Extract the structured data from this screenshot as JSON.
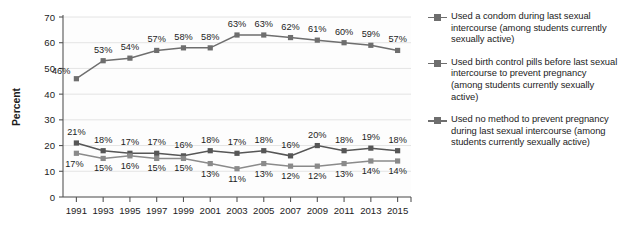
{
  "chart_data": {
    "type": "line",
    "title": "",
    "xlabel": "",
    "ylabel": "Percent",
    "ylim": [
      0,
      70
    ],
    "ytick_step": 10,
    "yticks": [
      0,
      10,
      20,
      30,
      40,
      50,
      60,
      70
    ],
    "grid": true,
    "grid_axis": "y",
    "legend_position": "right",
    "value_suffix": "%",
    "categories": [
      "1991",
      "1993",
      "1995",
      "1997",
      "1999",
      "2001",
      "2003",
      "2005",
      "2007",
      "2009",
      "2011",
      "2013",
      "2015"
    ],
    "series": [
      {
        "name": "Used a condom during last sexual intercourse (among students currently sexually active)",
        "color": "#6e6e6e",
        "values": [
          46,
          53,
          54,
          57,
          58,
          58,
          63,
          63,
          62,
          61,
          60,
          59,
          57
        ],
        "labels": [
          "46%",
          "53%",
          "54%",
          "57%",
          "58%",
          "58%",
          "63%",
          "63%",
          "62%",
          "61%",
          "60%",
          "59%",
          "57%"
        ]
      },
      {
        "name": "Used no method to prevent pregnancy during last sexual intercourse (among students currently sexually active)",
        "color": "#565656",
        "values": [
          21,
          18,
          17,
          17,
          16,
          18,
          17,
          18,
          16,
          20,
          18,
          19,
          18
        ],
        "labels": [
          "21%",
          "18%",
          "17%",
          "17%",
          "16%",
          "18%",
          "17%",
          "18%",
          "16%",
          "20%",
          "18%",
          "19%",
          "18%"
        ]
      },
      {
        "name": "Used birth control pills before last sexual intercourse to prevent pregnancy (among students currently sexually active)",
        "color": "#8a8a8a",
        "values": [
          17,
          15,
          16,
          15,
          15,
          13,
          11,
          13,
          12,
          12,
          13,
          14,
          14
        ],
        "labels": [
          "17%",
          "15%",
          "16%",
          "15%",
          "15%",
          "13%",
          "11%",
          "13%",
          "12%",
          "12%",
          "13%",
          "14%",
          "14%"
        ]
      }
    ]
  },
  "axis": {
    "y_title": "Percent",
    "y_tick_labels": [
      "70",
      "60",
      "50",
      "40",
      "30",
      "20",
      "10",
      "0"
    ],
    "x_tick_labels": [
      "1991",
      "1993",
      "1995",
      "1997",
      "1999",
      "2001",
      "2003",
      "2005",
      "2007",
      "2009",
      "2011",
      "2013",
      "2015"
    ]
  },
  "legend": {
    "entries": [
      {
        "label": "Used a condom during last sexual intercourse (among students currently sexually active)"
      },
      {
        "label": "Used birth control pills before last sexual intercourse to prevent pregnancy (among students currently sexually active)"
      },
      {
        "label": "Used no method to prevent pregnancy during last sexual intercourse (among students currently sexually active)"
      }
    ]
  },
  "colors": {
    "line_primary": "#6e6e6e",
    "line_secondary": "#565656",
    "line_tertiary": "#8a8a8a",
    "axis": "#555555",
    "grid": "#e4e4e4",
    "text": "#1c1c1c",
    "background": "#ffffff"
  }
}
